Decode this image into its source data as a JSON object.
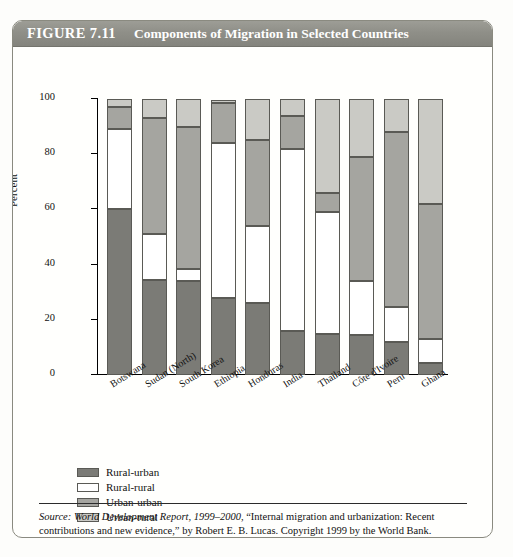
{
  "figure": {
    "number_label": "FIGURE 7.11",
    "title": "Components of Migration in Selected Countries"
  },
  "source_note": {
    "prefix": "Source:",
    "publication": "World Development Report, 1999–2000,",
    "rest": " “Internal migration and urbanization: Recent contributions and new evidence,” by Robert E. B. Lucas. Copyright 1999 by the World Bank."
  },
  "colors": {
    "rural_urban": "#7b7b76",
    "rural_rural": "#ffffff",
    "urban_urban": "#a5a5a0",
    "urban_rural": "#cacac5",
    "title_bar": "#8f8f88",
    "frame": "#8a8a80"
  },
  "legend": {
    "position": "below-axis-left",
    "items": [
      {
        "label": "Rural-urban",
        "key": "rural-urban"
      },
      {
        "label": "Rural-rural",
        "key": "rural-rural"
      },
      {
        "label": "Urban-urban",
        "key": "urban-urban"
      },
      {
        "label": "Urban-rural",
        "key": "urban-rural"
      }
    ]
  },
  "chart_data": {
    "type": "bar",
    "stacked": true,
    "title": "Components of Migration in Selected Countries",
    "xlabel": "",
    "ylabel": "Percent",
    "ylim": [
      0,
      100
    ],
    "yticks": [
      0,
      20,
      40,
      60,
      80,
      100
    ],
    "ytick_labels": [
      "0",
      "20",
      "40",
      "60",
      "80",
      "100"
    ],
    "grid": false,
    "categories": [
      "Botswana",
      "Sudan (North)",
      "South Korea",
      "Ethiopia",
      "Honduras",
      "India",
      "Thailand",
      "Côte d'Ivoire",
      "Peru",
      "Ghana"
    ],
    "series": [
      {
        "name": "Rural-urban",
        "color": "#7b7b76",
        "values": [
          60,
          34.5,
          34,
          28,
          26,
          16,
          15,
          14.5,
          12,
          4.5
        ]
      },
      {
        "name": "Rural-rural",
        "color": "#ffffff",
        "values": [
          29,
          16.5,
          4.5,
          56,
          28,
          66,
          44,
          19.5,
          12.5,
          8.5
        ]
      },
      {
        "name": "Urban-urban",
        "color": "#a5a5a0",
        "values": [
          8,
          42,
          51.5,
          14.5,
          31,
          12,
          7,
          45,
          63.5,
          49
        ]
      },
      {
        "name": "Urban-rural",
        "color": "#cacac5",
        "values": [
          3,
          7,
          10,
          1,
          15,
          6,
          34,
          21,
          12,
          38
        ]
      }
    ]
  }
}
